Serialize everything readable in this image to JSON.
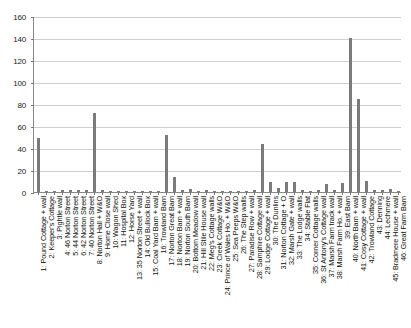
{
  "chart_data": {
    "type": "bar",
    "title": "",
    "subtitle": "",
    "xlabel": "",
    "ylabel": "",
    "ylim": [
      0,
      160
    ],
    "ytick_values": [
      0,
      20,
      40,
      60,
      80,
      100,
      120,
      140,
      160
    ],
    "ytick_labels": [
      "0",
      "20",
      "40",
      "60",
      "80",
      "100",
      "120",
      "140",
      "160"
    ],
    "grid": true,
    "legend": "none",
    "bar_color": "#7a7a7a",
    "categories": [
      "1: Pound Cottage + wall",
      "2: Keeper's Cottage",
      "3: Pightle wall",
      "4: 46 Norton Street",
      "5: 44 Norton Street",
      "6: 42 Norton Street",
      "7: 40 Norton Street",
      "8: Norton Hall + W&O",
      "9: Home Close wall",
      "10: Wagon Shed",
      "11: Hospital Box",
      "12: Horse Yard",
      "13: 35 Norton Street + wall",
      "14: Old Bullock Box",
      "15: Coal Yard Barn + wall",
      "16: Trowland Barn",
      "17: Norton Great Barn",
      "18: Norton Barn + wall",
      "19: Norton South Barn",
      "20: Bottom Meadow wall",
      "21: Hill Stile House wall",
      "22: Meg's Cottage walls",
      "23: Creek Cottage W&O",
      "24: Prince of Wales Ho. + W&O",
      "25: Sea Peeps W&O",
      "26: The Step walls",
      "27: Paradise Row + wall",
      "28: Samphire Cottage wall",
      "29: Lodge Cottage + wall",
      "30: The Dunlins",
      "31: Norton Cottage + O",
      "32: Marsh Gate + wall",
      "33: The Lodge walls",
      "34: Stable Flat",
      "35: Corner Cottage walls",
      "36: St Antony's Cottage wall",
      "37: Marsh Farm track wall",
      "38: Marsh Farm Ho. + wall",
      "39: East Barn",
      "40: North Barn + wall",
      "41: Cosy Cottage + wall",
      "42: Trowland Cottage",
      "43: Denning",
      "44: Lechmere",
      "45: Bradmere House + wall",
      "46: Great Farm Barn"
    ],
    "values": [
      49,
      1,
      1,
      2,
      2,
      2,
      2,
      72,
      2,
      1,
      1,
      1,
      1,
      1,
      1,
      1,
      52,
      14,
      2,
      3,
      1,
      2,
      1,
      1,
      1,
      1,
      1,
      2,
      44,
      9,
      4,
      9,
      9,
      2,
      1,
      2,
      7,
      2,
      8,
      140,
      85,
      10,
      2,
      2,
      3,
      1
    ]
  }
}
